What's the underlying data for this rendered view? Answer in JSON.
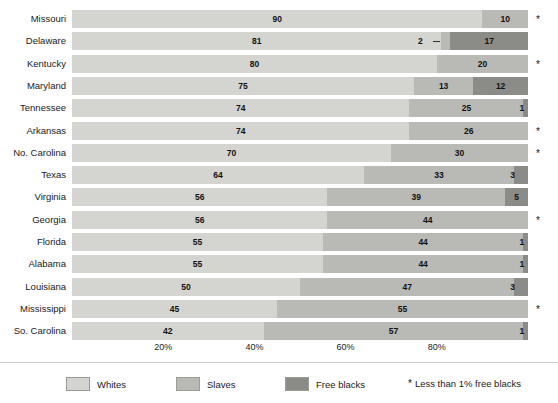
{
  "chart_data": {
    "type": "bar",
    "subtype": "stacked-horizontal-100-percent",
    "title": "",
    "subtitle": "",
    "xlabel": "",
    "ylabel": "",
    "xlim": [
      0,
      100
    ],
    "grid": false,
    "legend_position": "bottom",
    "categories": [
      "Missouri",
      "Delaware",
      "Kentucky",
      "Maryland",
      "Tennessee",
      "Arkansas",
      "No. Carolina",
      "Texas",
      "Virginia",
      "Georgia",
      "Florida",
      "Alabama",
      "Louisiana",
      "Mississippi",
      "So. Carolina"
    ],
    "series": [
      {
        "name": "Whites",
        "color": "#d4d4d1",
        "values": [
          90,
          81,
          80,
          75,
          74,
          74,
          70,
          64,
          56,
          56,
          55,
          55,
          50,
          45,
          42
        ]
      },
      {
        "name": "Slaves",
        "color": "#b9b9b6",
        "values": [
          10,
          2,
          20,
          13,
          25,
          26,
          30,
          33,
          39,
          44,
          44,
          44,
          47,
          55,
          57
        ]
      },
      {
        "name": "Free blacks",
        "color": "#8b8b88",
        "values": [
          0,
          17,
          0,
          12,
          1,
          0,
          0,
          3,
          5,
          0,
          1,
          1,
          3,
          0,
          1
        ]
      }
    ],
    "tick_labels": [
      "20%",
      "40%",
      "60%",
      "80%"
    ],
    "tick_values": [
      20,
      40,
      60,
      80
    ],
    "rows": [
      {
        "label": "Missouri",
        "whites": 90,
        "slaves": 10,
        "free": 0,
        "asterisk": true,
        "free_label": "",
        "slaves_leader": false
      },
      {
        "label": "Delaware",
        "whites": 81,
        "slaves": 2,
        "free": 17,
        "asterisk": false,
        "free_label": "17",
        "slaves_leader": true
      },
      {
        "label": "Kentucky",
        "whites": 80,
        "slaves": 20,
        "free": 0,
        "asterisk": true,
        "free_label": "",
        "slaves_leader": false
      },
      {
        "label": "Maryland",
        "whites": 75,
        "slaves": 13,
        "free": 12,
        "asterisk": false,
        "free_label": "12",
        "slaves_leader": false
      },
      {
        "label": "Tennessee",
        "whites": 74,
        "slaves": 25,
        "free": 1,
        "asterisk": false,
        "free_label": "1",
        "slaves_leader": false
      },
      {
        "label": "Arkansas",
        "whites": 74,
        "slaves": 26,
        "free": 0,
        "asterisk": true,
        "free_label": "",
        "slaves_leader": false
      },
      {
        "label": "No. Carolina",
        "whites": 70,
        "slaves": 30,
        "free": 0,
        "asterisk": true,
        "free_label": "",
        "slaves_leader": false
      },
      {
        "label": "Texas",
        "whites": 64,
        "slaves": 33,
        "free": 3,
        "asterisk": false,
        "free_label": "3",
        "slaves_leader": false
      },
      {
        "label": "Virginia",
        "whites": 56,
        "slaves": 39,
        "free": 5,
        "asterisk": false,
        "free_label": "5",
        "slaves_leader": false
      },
      {
        "label": "Georgia",
        "whites": 56,
        "slaves": 44,
        "free": 0,
        "asterisk": true,
        "free_label": "",
        "slaves_leader": false
      },
      {
        "label": "Florida",
        "whites": 55,
        "slaves": 44,
        "free": 1,
        "asterisk": false,
        "free_label": "1",
        "slaves_leader": false
      },
      {
        "label": "Alabama",
        "whites": 55,
        "slaves": 44,
        "free": 1,
        "asterisk": false,
        "free_label": "1",
        "slaves_leader": false
      },
      {
        "label": "Louisiana",
        "whites": 50,
        "slaves": 47,
        "free": 3,
        "asterisk": false,
        "free_label": "3",
        "slaves_leader": false
      },
      {
        "label": "Mississippi",
        "whites": 45,
        "slaves": 55,
        "free": 0,
        "asterisk": true,
        "free_label": "",
        "slaves_leader": false
      },
      {
        "label": "So. Carolina",
        "whites": 42,
        "slaves": 57,
        "free": 1,
        "asterisk": false,
        "free_label": "1",
        "slaves_leader": false
      }
    ]
  },
  "legend": {
    "items": [
      {
        "label": "Whites",
        "color": "#d4d4d1"
      },
      {
        "label": "Slaves",
        "color": "#b9b9b6"
      },
      {
        "label": "Free blacks",
        "color": "#8b8b88"
      }
    ],
    "note_symbol": "*",
    "note_text": "Less than 1% free blacks"
  }
}
